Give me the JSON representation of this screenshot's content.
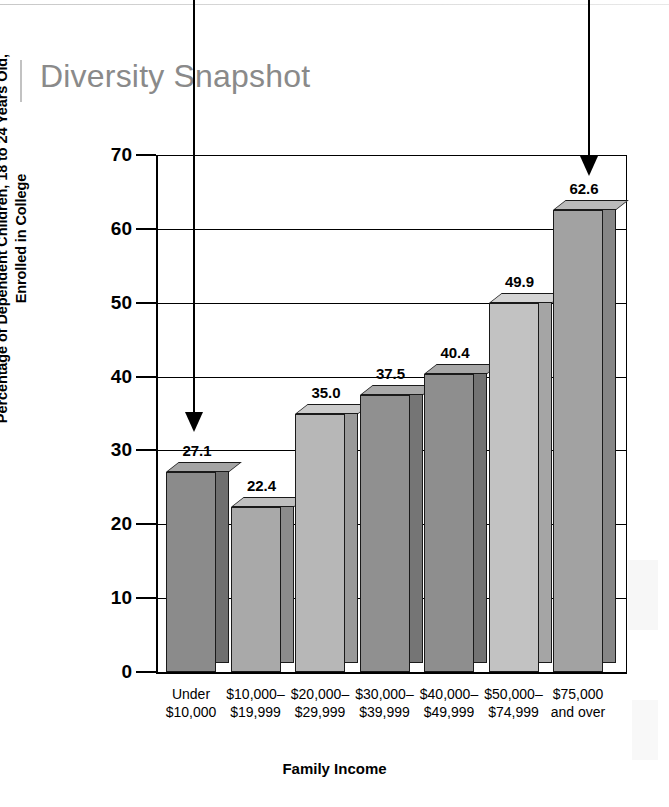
{
  "page": {
    "title": "Diversity Snapshot"
  },
  "chart_data": {
    "type": "bar",
    "title": "Diversity Snapshot",
    "xlabel": "Family Income",
    "ylabel": "Percentage of Dependent Children, 18 to 24 Years Old, Enrolled in College",
    "categories": [
      "Under\n$10,000",
      "$10,000–\n$19,999",
      "$20,000–\n$29,999",
      "$30,000–\n$39,999",
      "$40,000–\n$49,999",
      "$50,000–\n$74,999",
      "$75,000\nand over"
    ],
    "category_lines": [
      [
        "Under",
        "$10,000"
      ],
      [
        "$10,000–",
        "$19,999"
      ],
      [
        "$20,000–",
        "$29,999"
      ],
      [
        "$30,000–",
        "$39,999"
      ],
      [
        "$40,000–",
        "$49,999"
      ],
      [
        "$50,000–",
        "$74,999"
      ],
      [
        "$75,000",
        "and over"
      ]
    ],
    "values": [
      27.1,
      22.4,
      35.0,
      37.5,
      40.4,
      49.9,
      62.6
    ],
    "value_labels": [
      "27.1",
      "22.4",
      "35.0",
      "37.5",
      "40.4",
      "49.9",
      "62.6"
    ],
    "ylim": [
      0,
      70
    ],
    "yticks": [
      0,
      10,
      20,
      30,
      40,
      50,
      60,
      70
    ],
    "ytick_labels": [
      "0",
      "10",
      "20",
      "30",
      "40",
      "50",
      "60",
      "70"
    ],
    "grid": "horizontal",
    "legend": "none",
    "bar_colors": [
      "#8b8b8b",
      "#a9a9a9",
      "#b7b7b7",
      "#909090",
      "#8e8e8e",
      "#c2c2c2",
      "#a2a2a2"
    ],
    "bar_side_colors": [
      "#6f6f6f",
      "#8c8c8c",
      "#9a9a9a",
      "#757575",
      "#737373",
      "#a5a5a5",
      "#868686"
    ],
    "bar_top_colors": [
      "#a5a5a5",
      "#c0c0c0",
      "#cbcbcb",
      "#a9a9a9",
      "#a7a7a7",
      "#d4d4d4",
      "#bababa"
    ],
    "annotations": [
      {
        "name": "arrow-pointing-to-lowest-bar",
        "target": "27.1"
      },
      {
        "name": "arrow-pointing-to-highest-bar",
        "target": "62.6"
      }
    ]
  }
}
